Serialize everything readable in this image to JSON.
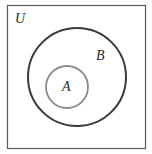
{
  "diagram": {
    "type": "venn",
    "title": "",
    "universe": {
      "label": "U",
      "shape": "rectangle",
      "stroke": "#5a5a5a"
    },
    "sets": [
      {
        "id": "B",
        "label": "B",
        "stroke": "#3a3a3a",
        "contains": [
          "A"
        ]
      },
      {
        "id": "A",
        "label": "A",
        "stroke": "#8a8a8a",
        "subset_of": "B"
      }
    ],
    "relationship": "A ⊂ B ⊂ U"
  }
}
